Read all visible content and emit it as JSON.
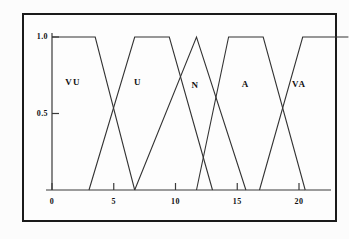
{
  "figure": {
    "title": "",
    "border_color": "#1a1a1a",
    "line_color": "#333333",
    "background": "#fdfdfd"
  },
  "axes": {
    "y_ticks": [
      {
        "label": "1.0",
        "value": 1.0
      },
      {
        "label": "0.5",
        "value": 0.5
      }
    ],
    "x_ticks": [
      {
        "label": "0",
        "value": 0
      },
      {
        "label": "5",
        "value": 5
      },
      {
        "label": "10",
        "value": 10
      },
      {
        "label": "15",
        "value": 15
      },
      {
        "label": "20",
        "value": 20
      }
    ],
    "xlabel": "",
    "ylabel": ""
  },
  "set_labels": [
    {
      "name": "VU",
      "x_pct": 16.2,
      "y_pct": 33.0
    },
    {
      "name": "U",
      "x_pct": 36.8,
      "y_pct": 33.0
    },
    {
      "name": "N",
      "x_pct": 55.0,
      "y_pct": 34.5
    },
    {
      "name": "A",
      "x_pct": 71.0,
      "y_pct": 34.0
    },
    {
      "name": "VA",
      "x_pct": 88.0,
      "y_pct": 34.0
    }
  ],
  "chart_data": {
    "type": "line",
    "xlabel": "",
    "ylabel": "",
    "xlim": [
      0,
      21
    ],
    "ylim": [
      0,
      1.05
    ],
    "grid": false,
    "legend": "inline-labels",
    "x_tick_labels": [
      "0",
      "5",
      "10",
      "15",
      "20"
    ],
    "x_tick_values": [
      0,
      5,
      10,
      15,
      20
    ],
    "y_tick_labels": [
      "0.5",
      "1.0"
    ],
    "y_tick_values": [
      0.5,
      1.0
    ],
    "series": [
      {
        "name": "VU",
        "shape": "trapezoid",
        "description": "Very Under - plateau at 1.0 from 0 to 3.5, falls to 0 at 6.7",
        "points": [
          [
            0,
            1.0
          ],
          [
            3.5,
            1.0
          ],
          [
            6.7,
            0.0
          ]
        ]
      },
      {
        "name": "U",
        "shape": "trapezoid",
        "description": "Under - rises from 0 at 3.0 to 1.0 at 6.7, plateau to 9.5, falls to 0 at 13.0",
        "points": [
          [
            3.0,
            0.0
          ],
          [
            6.7,
            1.0
          ],
          [
            9.5,
            1.0
          ],
          [
            13.0,
            0.0
          ]
        ]
      },
      {
        "name": "N",
        "shape": "triangle",
        "description": "Normal - rises from 0 at 6.7 to peak 1.0 at 11.7, falls to 0 at 15.7",
        "points": [
          [
            6.7,
            0.0
          ],
          [
            11.7,
            1.0
          ],
          [
            15.7,
            0.0
          ]
        ]
      },
      {
        "name": "A",
        "shape": "trapezoid",
        "description": "Above - rises from 0 at 11.7 to 1.0 at 14.3, plateau to 17.1, falls to 0 at 20.5",
        "points": [
          [
            11.7,
            0.0
          ],
          [
            14.3,
            1.0
          ],
          [
            17.1,
            1.0
          ],
          [
            20.5,
            0.0
          ]
        ]
      },
      {
        "name": "VA",
        "shape": "trapezoid",
        "description": "Very Above - rises from 0 at 16.8 to 1.0 at 20.3, plateau to end of axis",
        "points": [
          [
            16.8,
            0.0
          ],
          [
            20.3,
            1.0
          ],
          [
            24.0,
            1.0
          ]
        ]
      }
    ]
  }
}
